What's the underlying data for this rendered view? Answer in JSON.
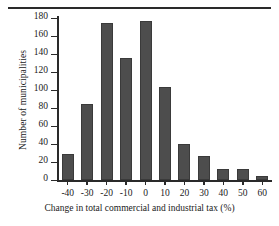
{
  "chart_data": {
    "type": "bar",
    "title": "",
    "xlabel": "Change in total commercial and industrial tax (%)",
    "ylabel": "Number of municipalities",
    "categories": [
      "-40",
      "-30",
      "-20",
      "-10",
      "0",
      "10",
      "20",
      "30",
      "40",
      "50",
      "60"
    ],
    "values": [
      29,
      84,
      175,
      136,
      177,
      103,
      40,
      27,
      12,
      12,
      4
    ],
    "xtick_labels": [
      "-40",
      "-30",
      "-20",
      "-10",
      "0",
      "10",
      "20",
      "30",
      "40",
      "50",
      "60"
    ],
    "ytick_labels": [
      "0",
      "20",
      "40",
      "60",
      "80",
      "100",
      "120",
      "140",
      "160",
      "180"
    ],
    "ytick_values": [
      0,
      20,
      40,
      60,
      80,
      100,
      120,
      140,
      160,
      180
    ],
    "ylim": [
      0,
      180
    ],
    "grid": false,
    "legend": null,
    "bar_color": "#4d4d4d",
    "axis_color": "#2a2a2a"
  },
  "figure": {
    "top_rule": true,
    "background": "#ffffff"
  }
}
